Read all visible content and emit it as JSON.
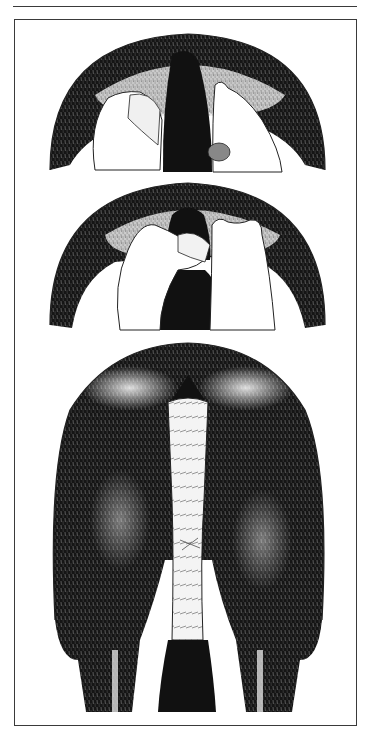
{
  "figure": {
    "description": "Three-step illustration of bandaging a horse's tail, viewed from behind",
    "panels": [
      {
        "step": 1,
        "label": "Hands begin wrapping bandage around top of tail"
      },
      {
        "step": 2,
        "label": "Hands fold tail hair up and continue wrapping"
      },
      {
        "step": 3,
        "label": "Finished tail bandage on horse's hindquarters"
      }
    ]
  },
  "colors": {
    "ink": "#111111",
    "paper": "#ffffff",
    "frame": "#3a3a3a",
    "fur_light": "#d9d9d9"
  }
}
